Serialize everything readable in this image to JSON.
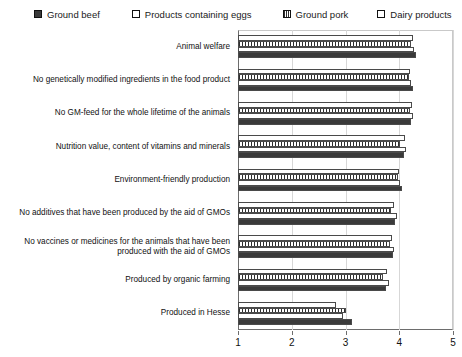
{
  "chart_data": {
    "type": "bar",
    "orientation": "horizontal",
    "title": "",
    "xlabel": "",
    "ylabel": "",
    "xlim": [
      1,
      5
    ],
    "xticks": [
      1,
      2,
      3,
      4,
      5
    ],
    "grid": true,
    "legend_position": "top",
    "categories": [
      "Animal welfare",
      "No genetically modified ingredients in the food product",
      "No GM-feed for the whole lifetime of the animals",
      "Nutrition value, content of vitamins and minerals",
      "Environment-friendly production",
      "No additives that have been produced by the aid of GMOs",
      "No vaccines or medicines for the animals that have been produced with the aid of GMOs",
      "Produced by organic farming",
      "Produced in Hesse"
    ],
    "series": [
      {
        "name": "Ground beef",
        "pattern": "solid",
        "color": "#3a3a3a",
        "values": [
          4.32,
          4.25,
          4.22,
          4.08,
          4.05,
          3.92,
          3.88,
          3.75,
          3.12
        ]
      },
      {
        "name": "Products containing eggs",
        "pattern": "empty",
        "color": "#ffffff",
        "values": [
          4.28,
          4.22,
          4.25,
          4.12,
          4.02,
          3.95,
          3.9,
          3.8,
          2.95
        ]
      },
      {
        "name": "Ground pork",
        "pattern": "hatch",
        "color": "#ffffff",
        "values": [
          4.22,
          4.18,
          4.2,
          4.02,
          3.98,
          3.85,
          3.82,
          3.7,
          3.0
        ]
      },
      {
        "name": "Dairy products",
        "pattern": "empty",
        "color": "#ffffff",
        "values": [
          4.26,
          4.2,
          4.24,
          4.1,
          4.0,
          3.9,
          3.86,
          3.78,
          2.82
        ]
      }
    ]
  },
  "legend": {
    "items": [
      {
        "label": "Ground beef",
        "pattern": "solid"
      },
      {
        "label": "Products containing eggs",
        "pattern": "empty"
      },
      {
        "label": "Ground pork",
        "pattern": "hatch"
      },
      {
        "label": "Dairy products",
        "pattern": "empty"
      }
    ]
  }
}
